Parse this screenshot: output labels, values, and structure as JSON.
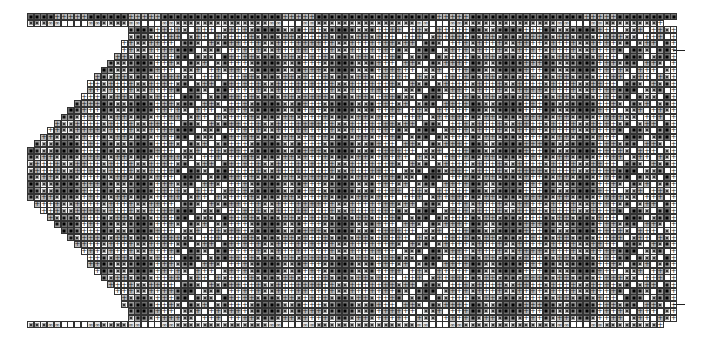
{
  "chart": {
    "type": "knitting-pattern-grid",
    "cell_size_px": 6.7,
    "origin": {
      "x": 27,
      "y": 13
    },
    "columns": 97,
    "rows": 48,
    "legend": {
      "B": "dark square with black dot",
      "D": "medium-dark square with black dot",
      "W": "light square with dot",
      "G": "gray square with plus",
      "P": "white square with plus",
      "E": "empty white square",
      "C": "cable (∞∞) cell"
    },
    "header_row": "BBBBGGGGGBBBBBBGGGGGBBBBBBBBBBBBBBBBBBGGGGGBBBBBBBBBBBBBBBBBBGGGGGBBBBBBBBBBBBBBBBBGGGGGBBBBBBBBBG",
    "border_row": "WWWCCEEEECCWWWWCCEEECCWWWWWWWWWWWWWWCCEEECCWWWWWWWWWWWWWWWCCEEECCWWWWWWWWWWWWWWCCEEECCWWWWWWWWP",
    "side_markers": [
      {
        "row": 5,
        "side": "right"
      },
      {
        "row": 43,
        "side": "right"
      }
    ],
    "stair_offsets": [
      15,
      15,
      14,
      14,
      13,
      12,
      11,
      10,
      9,
      9,
      8,
      7,
      6,
      5,
      4,
      3,
      2,
      1,
      0,
      0,
      0,
      0,
      0,
      0,
      0,
      0,
      1,
      2,
      3,
      4,
      5,
      6,
      7,
      8,
      9,
      9,
      10,
      11,
      12,
      13,
      14,
      14,
      15,
      15
    ]
  }
}
